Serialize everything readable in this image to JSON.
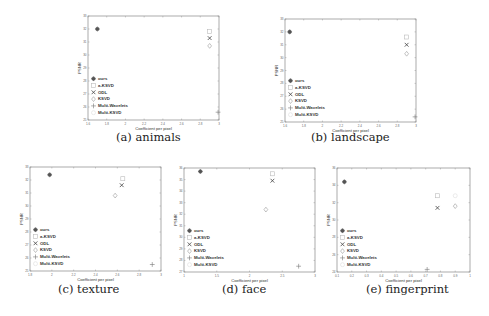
{
  "figure": {
    "legend_entries": [
      "ours",
      "a-KSVD",
      "ODL",
      "KSVD",
      "Multi-Wavelets",
      "Multi-KSVD"
    ],
    "colors": {
      "axis": "#777777",
      "marker": "#555555",
      "marker_light": "#bbbbbb",
      "text": "#333333"
    }
  },
  "chart_data": [
    {
      "type": "scatter",
      "caption": "(a) animals",
      "title": "",
      "xlabel": "Coefficient per pixel",
      "ylabel": "PSNR",
      "xlim": [
        1.6,
        3.0
      ],
      "ylim": [
        25,
        33
      ],
      "xticks": [
        "1.6",
        "1.8",
        "2",
        "2.2",
        "2.4",
        "2.6",
        "2.8",
        "3"
      ],
      "yticks": [
        "25",
        "26",
        "27",
        "28",
        "29",
        "30",
        "31",
        "32",
        "33"
      ],
      "legend": "lower-left",
      "series": [
        {
          "name": "ours",
          "x": [
            1.7
          ],
          "y": [
            32.0
          ]
        },
        {
          "name": "a-KSVD",
          "x": [
            2.9
          ],
          "y": [
            31.8
          ]
        },
        {
          "name": "ODL",
          "x": [
            2.9
          ],
          "y": [
            31.3
          ]
        },
        {
          "name": "KSVD",
          "x": [
            2.9
          ],
          "y": [
            30.7
          ]
        },
        {
          "name": "Multi-Wavelets",
          "x": [
            2.99
          ],
          "y": [
            25.6
          ]
        },
        {
          "name": "Multi-KSVD",
          "x": [],
          "y": []
        }
      ]
    },
    {
      "type": "scatter",
      "caption": "(b) landscape",
      "title": "",
      "xlabel": "Coefficient per pixel",
      "ylabel": "PSNR",
      "xlim": [
        1.6,
        3.0
      ],
      "ylim": [
        25,
        33
      ],
      "xticks": [
        "1.6",
        "1.8",
        "2",
        "2.2",
        "2.4",
        "2.6",
        "2.8",
        "3"
      ],
      "yticks": [
        "25",
        "26",
        "27",
        "28",
        "29",
        "30",
        "31",
        "32",
        "33"
      ],
      "legend": "lower-left",
      "series": [
        {
          "name": "ours",
          "x": [
            1.65
          ],
          "y": [
            32.0
          ]
        },
        {
          "name": "a-KSVD",
          "x": [
            2.9
          ],
          "y": [
            31.6
          ]
        },
        {
          "name": "ODL",
          "x": [
            2.9
          ],
          "y": [
            31.0
          ]
        },
        {
          "name": "KSVD",
          "x": [
            2.9
          ],
          "y": [
            30.3
          ]
        },
        {
          "name": "Multi-Wavelets",
          "x": [
            2.99
          ],
          "y": [
            25.4
          ]
        },
        {
          "name": "Multi-KSVD",
          "x": [],
          "y": []
        }
      ]
    },
    {
      "type": "scatter",
      "caption": "(c) texture",
      "title": "",
      "xlabel": "Coefficient per pixel",
      "ylabel": "PSNR",
      "xlim": [
        1.8,
        3.0
      ],
      "ylim": [
        25,
        33
      ],
      "xticks": [
        "1.8",
        "2",
        "2.2",
        "2.4",
        "2.6",
        "2.8",
        "3"
      ],
      "yticks": [
        "25",
        "26",
        "27",
        "28",
        "29",
        "30",
        "31",
        "32",
        "33"
      ],
      "legend": "lower-left",
      "series": [
        {
          "name": "ours",
          "x": [
            1.98
          ],
          "y": [
            32.4
          ]
        },
        {
          "name": "a-KSVD",
          "x": [
            2.65
          ],
          "y": [
            32.1
          ]
        },
        {
          "name": "ODL",
          "x": [
            2.64
          ],
          "y": [
            31.6
          ]
        },
        {
          "name": "KSVD",
          "x": [
            2.58
          ],
          "y": [
            30.8
          ]
        },
        {
          "name": "Multi-Wavelets",
          "x": [
            2.92
          ],
          "y": [
            25.5
          ]
        },
        {
          "name": "Multi-KSVD",
          "x": [],
          "y": []
        }
      ]
    },
    {
      "type": "scatter",
      "caption": "(d) face",
      "title": "",
      "xlabel": "Coefficient per pixel",
      "ylabel": "PSNR",
      "xlim": [
        1.0,
        3.0
      ],
      "ylim": [
        27,
        36
      ],
      "xticks": [
        "1",
        "1.5",
        "2",
        "2.5",
        "3"
      ],
      "yticks": [
        "27",
        "28",
        "29",
        "30",
        "31",
        "32",
        "33",
        "34",
        "35",
        "36"
      ],
      "legend": "lower-left",
      "series": [
        {
          "name": "ours",
          "x": [
            1.25
          ],
          "y": [
            35.7
          ]
        },
        {
          "name": "a-KSVD",
          "x": [
            2.35
          ],
          "y": [
            35.5
          ]
        },
        {
          "name": "ODL",
          "x": [
            2.35
          ],
          "y": [
            34.9
          ]
        },
        {
          "name": "KSVD",
          "x": [
            2.25
          ],
          "y": [
            32.4
          ]
        },
        {
          "name": "Multi-Wavelets",
          "x": [
            2.75
          ],
          "y": [
            27.5
          ]
        },
        {
          "name": "Multi-KSVD",
          "x": [],
          "y": []
        }
      ]
    },
    {
      "type": "scatter",
      "caption": "(e) fingerprint",
      "title": "",
      "xlabel": "Coefficient per pixel",
      "ylabel": "PSNR",
      "xlim": [
        0.1,
        1.0
      ],
      "ylim": [
        24,
        36
      ],
      "xticks": [
        "0.1",
        "0.2",
        "0.3",
        "0.4",
        "0.5",
        "0.6",
        "0.7",
        "0.8",
        "0.9",
        "1"
      ],
      "yticks": [
        "24",
        "26",
        "28",
        "30",
        "32",
        "34",
        "36"
      ],
      "legend": "lower-left",
      "series": [
        {
          "name": "ours",
          "x": [
            0.15
          ],
          "y": [
            34.4
          ]
        },
        {
          "name": "a-KSVD",
          "x": [
            0.78
          ],
          "y": [
            32.8
          ]
        },
        {
          "name": "ODL",
          "x": [
            0.78
          ],
          "y": [
            31.4
          ]
        },
        {
          "name": "KSVD",
          "x": [
            0.9
          ],
          "y": [
            31.6
          ]
        },
        {
          "name": "Multi-Wavelets",
          "x": [
            0.71
          ],
          "y": [
            24.3
          ]
        },
        {
          "name": "Multi-KSVD",
          "x": [
            0.9
          ],
          "y": [
            32.8
          ]
        }
      ]
    }
  ]
}
